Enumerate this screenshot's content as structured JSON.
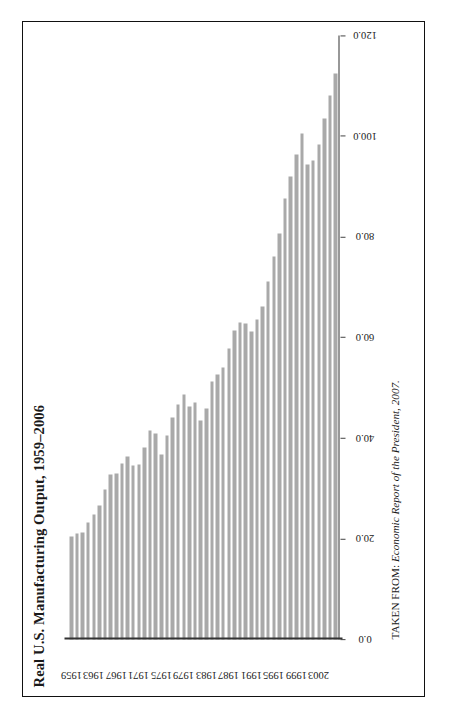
{
  "figure": {
    "title": "Real U.S. Manufacturing Output, 1959–2006",
    "source_prefix": "TAKEN FROM: ",
    "source_italic": "Economic Report of the President, 2007.",
    "bar_color": "#a9a9a9",
    "axis_color": "#333333",
    "frame_color": "#111111",
    "orientation": "rotated-90-ccw"
  },
  "chart_data": {
    "type": "bar",
    "title": "Real U.S. Manufacturing Output, 1959–2006",
    "xlabel": "",
    "ylabel": "",
    "orientation": "horizontal",
    "grid": false,
    "legend": "none",
    "ylim": [
      0.0,
      120.0
    ],
    "value_axis_ticks": [
      "0.0",
      "20.0",
      "40.0",
      "60.0",
      "80.0",
      "100.0",
      "120.0"
    ],
    "value_axis_tick_values": [
      0.0,
      20.0,
      40.0,
      60.0,
      80.0,
      100.0,
      120.0
    ],
    "category_axis_tick_labels": [
      "1959",
      "1963",
      "1967",
      "1971",
      "1975",
      "1979",
      "1983",
      "1987",
      "1991",
      "1995",
      "1999",
      "2003"
    ],
    "categories": [
      "1959",
      "1960",
      "1961",
      "1962",
      "1963",
      "1964",
      "1965",
      "1966",
      "1967",
      "1968",
      "1969",
      "1970",
      "1971",
      "1972",
      "1973",
      "1974",
      "1975",
      "1976",
      "1977",
      "1978",
      "1979",
      "1980",
      "1981",
      "1982",
      "1983",
      "1984",
      "1985",
      "1986",
      "1987",
      "1988",
      "1989",
      "1990",
      "1991",
      "1992",
      "1993",
      "1994",
      "1995",
      "1996",
      "1997",
      "1998",
      "1999",
      "2000",
      "2001",
      "2002",
      "2003",
      "2004",
      "2005",
      "2006"
    ],
    "values": [
      20.5,
      21.0,
      21.2,
      23.2,
      24.9,
      26.7,
      29.8,
      32.7,
      33.0,
      34.9,
      36.3,
      34.5,
      34.8,
      38.1,
      41.6,
      41.0,
      36.8,
      40.6,
      44.1,
      46.6,
      48.6,
      46.3,
      47.1,
      43.5,
      45.9,
      51.2,
      52.6,
      54.0,
      57.8,
      61.4,
      62.9,
      62.8,
      61.1,
      63.5,
      66.1,
      71.2,
      76.0,
      80.6,
      87.7,
      92.0,
      96.4,
      100.6,
      94.4,
      95.2,
      98.3,
      103.5,
      108.1,
      112.5
    ]
  },
  "a11y": {
    "plot_area_name": "bar-plot-area",
    "value_axis_name": "value-axis",
    "category_axis_name": "category-axis"
  }
}
